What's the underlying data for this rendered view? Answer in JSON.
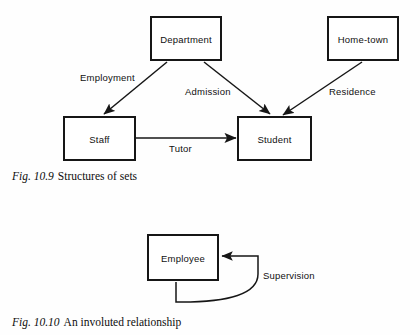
{
  "figures": [
    {
      "id": "fig-10-9",
      "caption_number": "Fig. 10.9",
      "caption_text": "Structures of sets",
      "entities": [
        {
          "name": "department",
          "label": "Department"
        },
        {
          "name": "home-town",
          "label": "Home-town"
        },
        {
          "name": "staff",
          "label": "Staff"
        },
        {
          "name": "student",
          "label": "Student"
        }
      ],
      "relationships": [
        {
          "name": "employment",
          "label": "Employment",
          "from": "Department",
          "to": "Staff"
        },
        {
          "name": "admission",
          "label": "Admission",
          "from": "Department",
          "to": "Student"
        },
        {
          "name": "residence",
          "label": "Residence",
          "from": "Home-town",
          "to": "Student"
        },
        {
          "name": "tutor",
          "label": "Tutor",
          "from": "Staff",
          "to": "Student"
        }
      ]
    },
    {
      "id": "fig-10-10",
      "caption_number": "Fig. 10.10",
      "caption_text": "An involuted relationship",
      "entities": [
        {
          "name": "employee",
          "label": "Employee"
        }
      ],
      "relationships": [
        {
          "name": "supervision",
          "label": "Supervision",
          "from": "Employee",
          "to": "Employee"
        }
      ]
    }
  ],
  "colors": {
    "ink": "#161616",
    "paper": "#fefefe"
  }
}
